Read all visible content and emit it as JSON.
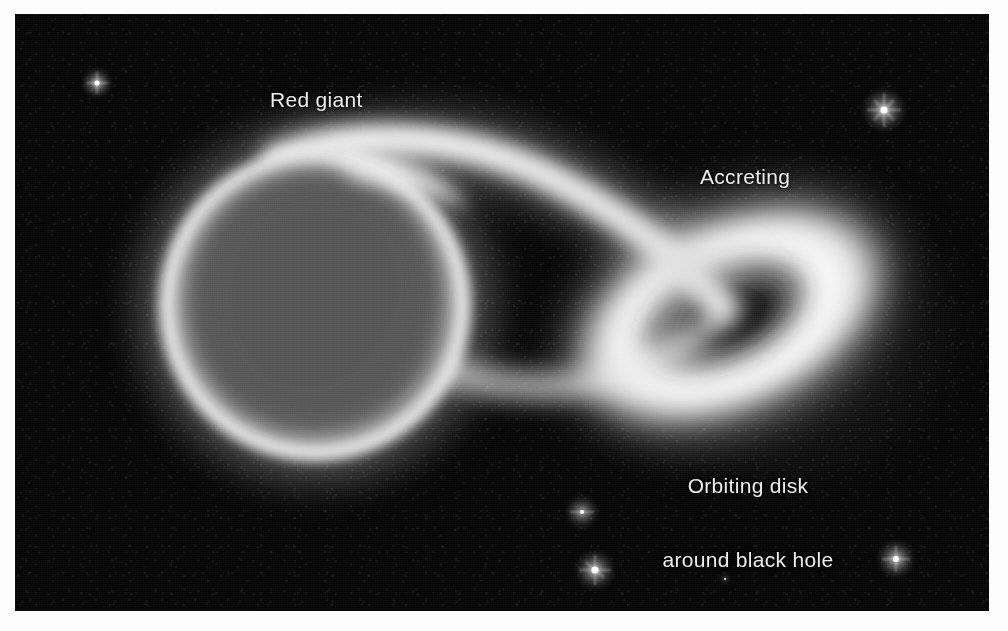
{
  "figure": {
    "kind": "astronomy-illustration",
    "page_background": "#fdfdfd",
    "plate_background": "#050505",
    "label_color": "#ededed"
  },
  "labels": {
    "red_giant": "Red giant",
    "accreting": "Accreting",
    "orbiting_line1": "Orbiting disk",
    "orbiting_line2": "around black hole"
  },
  "objects": {
    "red_giant": {
      "name": "red-giant-star",
      "center": [
        300,
        291
      ],
      "radius": 158,
      "limb_color": "#f2f2f2",
      "interior_color": "#585858"
    },
    "accretion_stream": {
      "name": "accreting-gas-stream",
      "color": "#efefef",
      "from": [
        395,
        165
      ],
      "to": [
        700,
        300
      ]
    },
    "accretion_disk": {
      "name": "orbiting-disk",
      "center": [
        715,
        301
      ],
      "semi_major": 175,
      "semi_minor": 104,
      "tilt_degrees": -24,
      "disk_color": "#f4f4f4"
    },
    "black_hole": {
      "name": "black-hole",
      "center": [
        715,
        301
      ],
      "semi_major": 55,
      "semi_minor": 30,
      "color": "#030303"
    }
  },
  "stars": [
    {
      "name": "background-star-upper-left",
      "x": 67,
      "y": 54,
      "size": 30,
      "brightness": 0.95
    },
    {
      "name": "background-star-upper-right",
      "x": 847,
      "y": 74,
      "size": 44,
      "brightness": 1.0
    },
    {
      "name": "background-star-lower-mid-1",
      "x": 550,
      "y": 481,
      "size": 34,
      "brightness": 0.82
    },
    {
      "name": "background-star-lower-mid-2",
      "x": 560,
      "y": 536,
      "size": 40,
      "brightness": 1.0
    },
    {
      "name": "background-star-lower-right",
      "x": 862,
      "y": 526,
      "size": 38,
      "brightness": 0.95
    },
    {
      "name": "background-star-faint-mid",
      "x": 706,
      "y": 561,
      "size": 8,
      "brightness": 0.7
    }
  ]
}
